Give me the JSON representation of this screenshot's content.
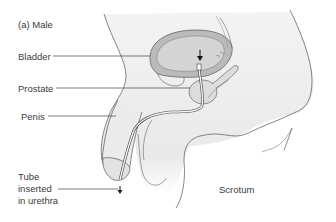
{
  "figure": {
    "panel_label": "(a) Male",
    "labels": {
      "bladder": "Bladder",
      "prostate": "Prostate",
      "penis": "Penis",
      "tube_line1": "Tube",
      "tube_line2": "inserted",
      "tube_line3": "in urethra",
      "scrotum": "Scrotum"
    },
    "colors": {
      "body_fill": "#ececec",
      "bladder_wall": "#b8b8b8",
      "bladder_inner": "#d2d2d2",
      "outline": "#555555",
      "leader_line": "#444444"
    }
  }
}
